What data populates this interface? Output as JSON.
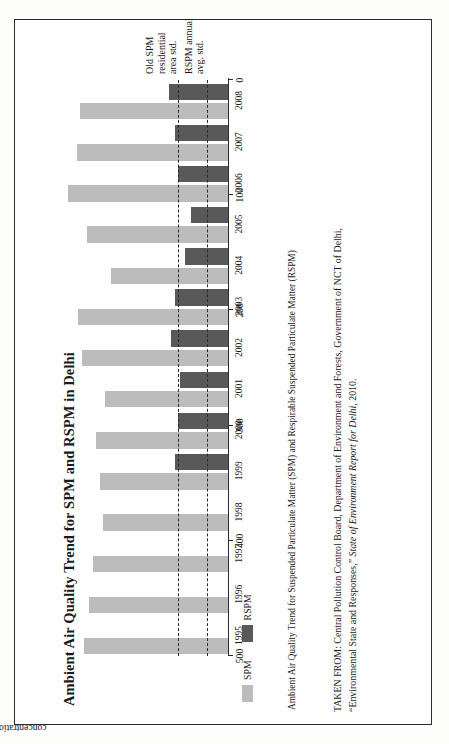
{
  "page": {
    "title": "Ambient Air Quality Trend for SPM and RSPM in Delhi",
    "caption": "Ambient Air Quality Trend for Suspended Particulate Matter (SPM) and Respirable Suspended Particulate Matter (RSPM)",
    "source_line1": "TAKEN FROM: Central Pollution Control Board, Department of Environment and Forests, Government of NCT of Delhi,",
    "source_line2_pre": "“Environmental State and Responses,” ",
    "source_line2_italic": "State of Environment Report for Delhi",
    "source_line2_post": ", 2010."
  },
  "annotations": {
    "old_spm_std": "Old SPM\nresidential\narea std.",
    "rspm_std": "RSPM annual\navg. std."
  },
  "legend": {
    "items": [
      {
        "label": "SPM",
        "color": "#bcbcbc"
      },
      {
        "label": "RSPM",
        "color": "#595959"
      }
    ]
  },
  "colors": {
    "spm": "#bcbcbc",
    "rspm": "#595959",
    "axis": "#2b2b2b",
    "page": "#fdfdfc"
  },
  "chart_data": {
    "type": "bar",
    "orientation": "horizontal",
    "title": "Ambient Air Quality Trend for SPM and RSPM in Delhi",
    "xlabel": "",
    "ylabel": "concentration (µg/m³)",
    "ylim": [
      0,
      500
    ],
    "yticks": [
      0,
      100,
      200,
      300,
      400,
      500
    ],
    "grid": false,
    "legend_position": "bottom-left",
    "categories": [
      "1995",
      "1996",
      "1997",
      "1998",
      "1999",
      "2000",
      "2001",
      "2002",
      "2003",
      "2004",
      "2005",
      "2006",
      "2007",
      "2008"
    ],
    "series": [
      {
        "name": "SPM",
        "color": "#bcbcbc",
        "values": [
          405,
          390,
          380,
          350,
          360,
          370,
          345,
          410,
          420,
          330,
          395,
          450,
          425,
          415
        ]
      },
      {
        "name": "RSPM",
        "color": "#595959",
        "values": [
          null,
          null,
          null,
          null,
          150,
          140,
          135,
          160,
          150,
          120,
          105,
          140,
          150,
          165
        ]
      }
    ],
    "reference_lines": [
      {
        "label": "Old SPM residential area std.",
        "value": 140,
        "style": "dashed"
      },
      {
        "label": "RSPM annual avg. std.",
        "value": 60,
        "style": "dashed"
      }
    ]
  }
}
